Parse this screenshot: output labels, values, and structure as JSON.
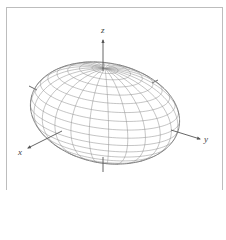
{
  "figure": {
    "type": "3d-wireframe-surface",
    "surface": "ellipsoid",
    "axes": {
      "x_label": "x",
      "y_label": "y",
      "z_label": "z"
    },
    "colors": {
      "frame": "#bdbdbd",
      "mesh": "#8a8a8a",
      "outline": "#7a7a7a",
      "axis": "#555555",
      "label": "#444444"
    },
    "geometry": {
      "center": [
        105,
        113
      ],
      "semi_axes": {
        "a": 58,
        "b": 82,
        "c": 48
      },
      "azimuth_deg": 36,
      "elevation_deg": 22,
      "meridians": 24,
      "parallels": 18
    }
  }
}
